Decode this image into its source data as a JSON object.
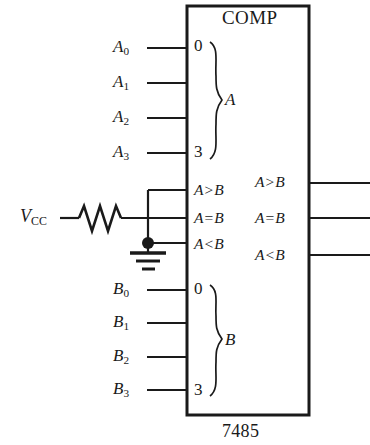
{
  "diagram": {
    "type": "logic-block-schematic",
    "device_block": {
      "title": "COMP",
      "part_number": "7485",
      "box": {
        "x": 187,
        "y": 6,
        "width": 122,
        "height": 409
      }
    },
    "input_group_a": {
      "group_label": "A",
      "pin_first": "0",
      "pin_last": "3",
      "signals": [
        {
          "base": "A",
          "sub": "0",
          "y": 48
        },
        {
          "base": "A",
          "sub": "1",
          "y": 83
        },
        {
          "base": "A",
          "sub": "2",
          "y": 118
        },
        {
          "base": "A",
          "sub": "3",
          "y": 153
        }
      ]
    },
    "input_group_b": {
      "group_label": "B",
      "pin_first": "0",
      "pin_last": "3",
      "signals": [
        {
          "base": "B",
          "sub": "0",
          "y": 290
        },
        {
          "base": "B",
          "sub": "1",
          "y": 323
        },
        {
          "base": "B",
          "sub": "2",
          "y": 357
        },
        {
          "base": "B",
          "sub": "3",
          "y": 390
        }
      ]
    },
    "cascade_inputs": [
      {
        "left": "A",
        "op": ">",
        "right": "B",
        "y": 190
      },
      {
        "left": "A",
        "op": "=",
        "right": "B",
        "y": 218
      },
      {
        "left": "A",
        "op": "<",
        "right": "B",
        "y": 244
      }
    ],
    "outputs": [
      {
        "left": "A",
        "op": ">",
        "right": "B",
        "y": 183
      },
      {
        "left": "A",
        "op": "=",
        "right": "B",
        "y": 218
      },
      {
        "left": "A",
        "op": "<",
        "right": "B",
        "y": 255
      }
    ],
    "power": {
      "supply_label": "V",
      "supply_sub": "CC",
      "resistor": {
        "x_start": 78,
        "x_end": 121,
        "y": 218
      },
      "pullup_node_x": 148,
      "ground_node_y": 243
    },
    "colors": {
      "background": "#ffffff",
      "ink": "#1a1a1a",
      "wire": "#262626"
    }
  }
}
